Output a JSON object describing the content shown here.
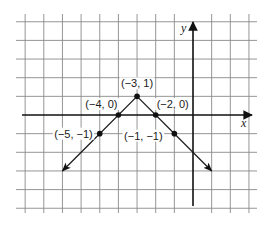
{
  "chart_data": {
    "type": "line",
    "title": "",
    "xlabel": "x",
    "ylabel": "y",
    "xlim": [
      -9,
      3
    ],
    "ylim": [
      -5,
      5
    ],
    "grid": true,
    "tick_labels_shown": false,
    "series": [
      {
        "name": "y = -|x + 3| + 1",
        "kind": "absolute-value (inverted V), rays with arrows at both ends",
        "points": [
          {
            "x": -5,
            "y": -1,
            "label": "(−5, −1)"
          },
          {
            "x": -4,
            "y": 0,
            "label": "(−4, 0)"
          },
          {
            "x": -3,
            "y": 1,
            "label": "(−3, 1)"
          },
          {
            "x": -2,
            "y": 0,
            "label": "(−2, 0)"
          },
          {
            "x": -1,
            "y": -1,
            "label": "(−1, −1)"
          }
        ],
        "left_arrow_end": {
          "x": -7,
          "y": -3
        },
        "right_arrow_end": {
          "x": 1,
          "y": -3
        }
      }
    ]
  },
  "axes": {
    "x_label": "x",
    "y_label": "y"
  },
  "style": {
    "line_color": "#1a1a1a",
    "grid_color": "#8a8a8a",
    "background": "#ffffff"
  }
}
